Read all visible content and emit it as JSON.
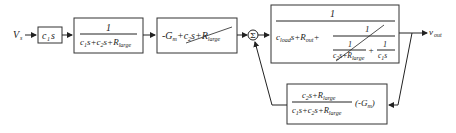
{
  "diagram": {
    "type": "block-diagram",
    "input": {
      "label": "V",
      "sub": "s"
    },
    "output": {
      "label": "v",
      "sub": "out"
    },
    "blocks": [
      {
        "id": "b1",
        "expr": "c1 s",
        "text_main": "c",
        "text_sub": "1",
        "text_tail": "s"
      },
      {
        "id": "b2",
        "numerator": "1",
        "denominator": "c1s+c2s+Rlarge",
        "den_parts": [
          "c",
          "1",
          "s+c",
          "2",
          "s+R",
          "large"
        ]
      },
      {
        "id": "b3",
        "expr": "-Gm + c2s + Rlarge (struck through)",
        "parts": [
          "-G",
          "m",
          "+c",
          "2",
          "s+R",
          "large"
        ]
      },
      {
        "id": "b4",
        "numerator": "1",
        "den_left": [
          "c",
          "load",
          "s+R",
          "out",
          "+"
        ],
        "inner_num": "1",
        "inner_den_left_num": "1",
        "inner_den_left_den": [
          "c",
          "2",
          "s+R",
          "large"
        ],
        "inner_den_plus": "+",
        "inner_den_right_num": "1",
        "inner_den_right_den": [
          "c",
          "1",
          "s"
        ]
      },
      {
        "id": "b5",
        "numerator": [
          "c",
          "2",
          "s+R",
          "large"
        ],
        "denominator": [
          "c",
          "1",
          "s+c",
          "2",
          "s+R",
          "large"
        ],
        "gain": [
          "(-G",
          "m",
          ")"
        ]
      }
    ],
    "summing_junction": {
      "symbol": "Σ"
    }
  }
}
